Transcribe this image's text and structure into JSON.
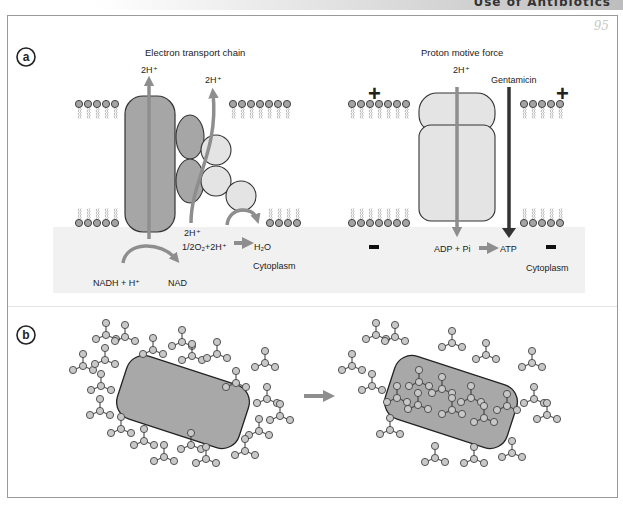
{
  "header": {
    "running_title": "Use of Antibiotics",
    "page_number": "95"
  },
  "panel_a": {
    "label": "a",
    "left": {
      "title": "Electron transport chain",
      "proton_top_1": "2H⁺",
      "proton_top_2": "2H⁺",
      "proton_bottom": "2H⁺",
      "oxygen_reaction": "1/2O₂+2H⁺",
      "water": "H₂O",
      "nadh": "NADH + H⁺",
      "nad": "NAD",
      "cytoplasm": "Cytoplasm"
    },
    "right": {
      "title": "Proton motive force",
      "proton_top": "2H⁺",
      "gentamicin": "Gentamicin",
      "plus_sign": "+",
      "minus_sign": "−",
      "adp": "ADP + Pi",
      "atp": "ATP",
      "cytoplasm": "Cytoplasm"
    }
  },
  "panel_b": {
    "label": "b",
    "before": "Bacterium surrounded by antibiotic molecules",
    "after": "Antibiotic molecules taken up into bacterium"
  },
  "colors": {
    "complex_dark": "#a6a6a6",
    "complex_light": "#e4e4e4",
    "arrow": "#8e8e8e",
    "gentamicin_arrow": "#3a3a3a",
    "cytoplasm_bg": "#f1f1f1",
    "bacterium": "#a8a8a8"
  }
}
